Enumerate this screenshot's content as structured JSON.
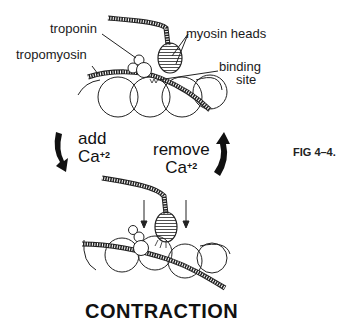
{
  "top_panel": {
    "title_cut": "RELAXATION",
    "labels": {
      "troponin": "troponin",
      "tropomyosin": "tropomyosin",
      "myosin_heads": "myosin heads",
      "binding_site_1": "binding",
      "binding_site_2": "site"
    }
  },
  "transitions": {
    "add_label": "add",
    "add_ion": "Ca",
    "add_charge": "+2",
    "remove_label": "remove",
    "remove_ion": "Ca",
    "remove_charge": "+2"
  },
  "figure_label": "FIG 4–4.",
  "bottom_panel": {
    "title": "CONTRACTION"
  },
  "colors": {
    "ink": "#111111",
    "background": "#ffffff"
  }
}
